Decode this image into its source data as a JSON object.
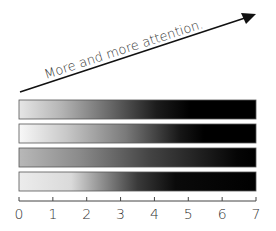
{
  "annotation": {
    "text": "More and more attention."
  },
  "axis": {
    "ticks": [
      "0",
      "1",
      "2",
      "3",
      "4",
      "5",
      "6",
      "7"
    ],
    "min": 0,
    "max": 7
  },
  "bars": [
    {
      "name": "bar-1",
      "stops": [
        [
          "0%",
          "#e6e6e6"
        ],
        [
          "18%",
          "#b4b4b4"
        ],
        [
          "38%",
          "#6a6a6a"
        ],
        [
          "58%",
          "#1c1c1c"
        ],
        [
          "72%",
          "#000000"
        ],
        [
          "100%",
          "#000000"
        ]
      ]
    },
    {
      "name": "bar-2",
      "stops": [
        [
          "0%",
          "#f8f8f8"
        ],
        [
          "20%",
          "#c8c8c8"
        ],
        [
          "45%",
          "#7a7a7a"
        ],
        [
          "68%",
          "#161616"
        ],
        [
          "78%",
          "#000000"
        ],
        [
          "100%",
          "#000000"
        ]
      ]
    },
    {
      "name": "bar-3",
      "stops": [
        [
          "0%",
          "#b8b8b8"
        ],
        [
          "25%",
          "#8c8c8c"
        ],
        [
          "55%",
          "#444444"
        ],
        [
          "82%",
          "#161616"
        ],
        [
          "92%",
          "#050505"
        ],
        [
          "100%",
          "#000000"
        ]
      ]
    },
    {
      "name": "bar-4",
      "stops": [
        [
          "0%",
          "#ececec"
        ],
        [
          "22%",
          "#dadada"
        ],
        [
          "32%",
          "#a0a0a0"
        ],
        [
          "50%",
          "#3a3a3a"
        ],
        [
          "66%",
          "#0a0a0a"
        ],
        [
          "100%",
          "#000000"
        ]
      ]
    }
  ]
}
